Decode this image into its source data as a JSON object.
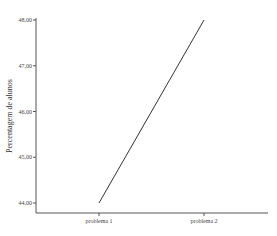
{
  "chart_data": {
    "type": "line",
    "title": "",
    "xlabel": "",
    "ylabel": "Percentagem de alunos",
    "categories": [
      "problema 1",
      "problema 2"
    ],
    "values": [
      44.0,
      48.0
    ],
    "ylim": [
      43.8,
      48.0
    ],
    "yticks": [
      "44,00",
      "45,00",
      "46,00",
      "47,00",
      "48,00"
    ],
    "grid": false,
    "legend": null
  }
}
